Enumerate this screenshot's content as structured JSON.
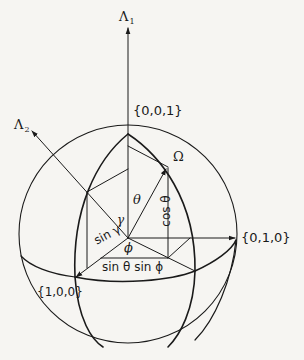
{
  "diagram": {
    "type": "unit-sphere-angle-diagram",
    "axes": {
      "lambda1": {
        "symbol": "Λ",
        "sub": "1"
      },
      "lambda2": {
        "symbol": "Λ",
        "sub": "2"
      }
    },
    "points": {
      "p001": "{0,0,1}",
      "p010": "{0,1,0}",
      "p100": "{1,0,0}",
      "omega": "Ω"
    },
    "angles": {
      "theta": "θ",
      "gamma": "γ",
      "phi": "ϕ"
    },
    "segments": {
      "cos_theta": "cos θ",
      "sin_gamma": "sin γ",
      "sin_theta_sin_phi": "sin θ sin ϕ"
    },
    "colors": {
      "ink": "#1a1a1a",
      "paper": "#f6f5f2"
    }
  }
}
